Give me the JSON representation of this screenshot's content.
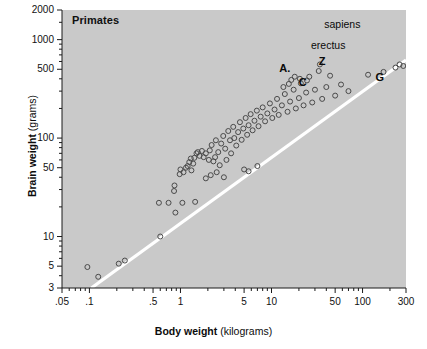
{
  "chart_data": {
    "type": "scatter",
    "title": "Primates",
    "xlabel_main": "Body weight",
    "xlabel_unit": "(kilograms)",
    "ylabel_main": "Brain weight",
    "ylabel_unit": "(grams)",
    "xscale": "log",
    "yscale": "log",
    "xlim": [
      0.05,
      300
    ],
    "ylim": [
      3,
      2000
    ],
    "grid": false,
    "legend": "none",
    "background_color": "#c9c9c9",
    "marker_color": "#4a4a4a",
    "marker_style": "open-circle",
    "reference_line": {
      "label": "white diagonal reference line",
      "color": "#ffffff",
      "x_start": 0.105,
      "y_start": 3.0,
      "x_end": 300,
      "y_end": 620
    },
    "x_ticks": [
      {
        "value": 0.05,
        "label": ".05"
      },
      {
        "value": 0.1,
        "label": ".1"
      },
      {
        "value": 0.5,
        "label": ".5"
      },
      {
        "value": 1,
        "label": "1"
      },
      {
        "value": 5,
        "label": "5"
      },
      {
        "value": 10,
        "label": "10"
      },
      {
        "value": 50,
        "label": "50"
      },
      {
        "value": 100,
        "label": "100"
      },
      {
        "value": 300,
        "label": "300"
      }
    ],
    "x_minor_ticks": [
      0.06,
      0.07,
      0.08,
      0.09,
      0.2,
      0.3,
      0.4,
      0.6,
      0.7,
      0.8,
      0.9,
      2,
      3,
      4,
      6,
      7,
      8,
      9,
      20,
      30,
      40,
      60,
      70,
      80,
      90,
      200
    ],
    "y_ticks": [
      {
        "value": 3,
        "label": "3"
      },
      {
        "value": 5,
        "label": "5"
      },
      {
        "value": 10,
        "label": "10"
      },
      {
        "value": 50,
        "label": "50"
      },
      {
        "value": 100,
        "label": "100"
      },
      {
        "value": 500,
        "label": "500"
      },
      {
        "value": 1000,
        "label": "1000"
      },
      {
        "value": 2000,
        "label": "2000"
      }
    ],
    "y_minor_ticks": [
      4,
      6,
      7,
      8,
      9,
      20,
      30,
      40,
      60,
      70,
      80,
      90,
      200,
      300,
      400,
      600,
      700,
      800,
      900,
      1500
    ],
    "annotations": [
      {
        "text": "sapiens",
        "x": 60,
        "y": 1450,
        "style": "plain"
      },
      {
        "text": "erectus",
        "x": 42,
        "y": 880,
        "style": "plain"
      },
      {
        "text": "Z",
        "x": 36,
        "y": 610,
        "style": "bold"
      },
      {
        "text": "A.",
        "x": 14,
        "y": 520,
        "style": "bold"
      },
      {
        "text": "C",
        "x": 22,
        "y": 370,
        "style": "bold"
      },
      {
        "text": "G",
        "x": 155,
        "y": 420,
        "style": "bold"
      }
    ],
    "points": [
      {
        "x": 0.095,
        "y": 4.9
      },
      {
        "x": 0.125,
        "y": 3.9
      },
      {
        "x": 0.21,
        "y": 5.3
      },
      {
        "x": 0.245,
        "y": 5.7
      },
      {
        "x": 0.6,
        "y": 10.0
      },
      {
        "x": 0.58,
        "y": 22.0
      },
      {
        "x": 0.74,
        "y": 22.0
      },
      {
        "x": 0.85,
        "y": 29.0
      },
      {
        "x": 0.86,
        "y": 33.0
      },
      {
        "x": 0.88,
        "y": 17.5
      },
      {
        "x": 1.05,
        "y": 22.0
      },
      {
        "x": 1.45,
        "y": 22.5
      },
      {
        "x": 1.15,
        "y": 50.0
      },
      {
        "x": 1.2,
        "y": 52.0
      },
      {
        "x": 1.25,
        "y": 57.0
      },
      {
        "x": 1.3,
        "y": 62.0
      },
      {
        "x": 1.38,
        "y": 55.0
      },
      {
        "x": 1.42,
        "y": 63.0
      },
      {
        "x": 1.5,
        "y": 70.0
      },
      {
        "x": 1.55,
        "y": 72.0
      },
      {
        "x": 1.62,
        "y": 66.0
      },
      {
        "x": 1.72,
        "y": 74.0
      },
      {
        "x": 1.8,
        "y": 64.0
      },
      {
        "x": 1.9,
        "y": 70.0
      },
      {
        "x": 2.05,
        "y": 60.0
      },
      {
        "x": 2.1,
        "y": 75.0
      },
      {
        "x": 2.2,
        "y": 85.0
      },
      {
        "x": 2.3,
        "y": 58.0
      },
      {
        "x": 2.4,
        "y": 64.0
      },
      {
        "x": 2.45,
        "y": 95.0
      },
      {
        "x": 2.6,
        "y": 72.0
      },
      {
        "x": 2.7,
        "y": 53.0
      },
      {
        "x": 2.8,
        "y": 88.0
      },
      {
        "x": 2.95,
        "y": 105.0
      },
      {
        "x": 3.1,
        "y": 78.0
      },
      {
        "x": 3.2,
        "y": 60.0
      },
      {
        "x": 3.35,
        "y": 118.0
      },
      {
        "x": 3.5,
        "y": 95.0
      },
      {
        "x": 3.6,
        "y": 70.0
      },
      {
        "x": 3.8,
        "y": 130.0
      },
      {
        "x": 3.9,
        "y": 100.0
      },
      {
        "x": 4.1,
        "y": 84.0
      },
      {
        "x": 4.3,
        "y": 115.0
      },
      {
        "x": 4.5,
        "y": 145.0
      },
      {
        "x": 4.7,
        "y": 96.0
      },
      {
        "x": 4.9,
        "y": 125.0
      },
      {
        "x": 5.2,
        "y": 160.0
      },
      {
        "x": 5.4,
        "y": 108.0
      },
      {
        "x": 5.6,
        "y": 135.0
      },
      {
        "x": 5.9,
        "y": 175.0
      },
      {
        "x": 6.2,
        "y": 120.0
      },
      {
        "x": 6.5,
        "y": 150.0
      },
      {
        "x": 6.9,
        "y": 190.0
      },
      {
        "x": 7.2,
        "y": 132.0
      },
      {
        "x": 7.6,
        "y": 165.0
      },
      {
        "x": 8.0,
        "y": 205.0
      },
      {
        "x": 8.5,
        "y": 148.0
      },
      {
        "x": 9.0,
        "y": 178.0
      },
      {
        "x": 9.6,
        "y": 225.0
      },
      {
        "x": 10.2,
        "y": 160.0
      },
      {
        "x": 10.8,
        "y": 195.0
      },
      {
        "x": 11.5,
        "y": 250.0
      },
      {
        "x": 12.0,
        "y": 172.0
      },
      {
        "x": 13.0,
        "y": 215.0
      },
      {
        "x": 14.0,
        "y": 280.0
      },
      {
        "x": 15.0,
        "y": 185.0
      },
      {
        "x": 16.0,
        "y": 235.0
      },
      {
        "x": 17.5,
        "y": 310.0
      },
      {
        "x": 18.5,
        "y": 200.0
      },
      {
        "x": 20.0,
        "y": 255.0
      },
      {
        "x": 21.0,
        "y": 360.0
      },
      {
        "x": 22.5,
        "y": 215.0
      },
      {
        "x": 24.0,
        "y": 290.0
      },
      {
        "x": 26.0,
        "y": 420.0
      },
      {
        "x": 28.0,
        "y": 230.0
      },
      {
        "x": 30.0,
        "y": 310.0
      },
      {
        "x": 33.0,
        "y": 480.0
      },
      {
        "x": 36.0,
        "y": 250.0
      },
      {
        "x": 40.0,
        "y": 330.0
      },
      {
        "x": 44.0,
        "y": 430.0
      },
      {
        "x": 50.0,
        "y": 270.0
      },
      {
        "x": 58.0,
        "y": 350.0
      },
      {
        "x": 70.0,
        "y": 300.0
      },
      {
        "x": 1.9,
        "y": 39.0
      },
      {
        "x": 2.15,
        "y": 42.0
      },
      {
        "x": 2.5,
        "y": 45.0
      },
      {
        "x": 3.0,
        "y": 40.0
      },
      {
        "x": 5.0,
        "y": 48.0
      },
      {
        "x": 5.6,
        "y": 46.0
      },
      {
        "x": 7.0,
        "y": 52.0
      },
      {
        "x": 1.0,
        "y": 48.0
      },
      {
        "x": 1.08,
        "y": 45.0
      },
      {
        "x": 1.32,
        "y": 47.0
      },
      {
        "x": 0.98,
        "y": 43.0
      },
      {
        "x": 170.0,
        "y": 470.0
      },
      {
        "x": 230.0,
        "y": 520.0
      },
      {
        "x": 255.0,
        "y": 560.0
      },
      {
        "x": 280.0,
        "y": 540.0
      },
      {
        "x": 115.0,
        "y": 440.0
      },
      {
        "x": 34.0,
        "y": 560.0
      },
      {
        "x": 18.0,
        "y": 420.0
      },
      {
        "x": 20.5,
        "y": 400.0
      },
      {
        "x": 16.5,
        "y": 390.0
      },
      {
        "x": 15.5,
        "y": 355.0
      },
      {
        "x": 13.5,
        "y": 330.0
      },
      {
        "x": 24.5,
        "y": 385.0
      }
    ]
  }
}
